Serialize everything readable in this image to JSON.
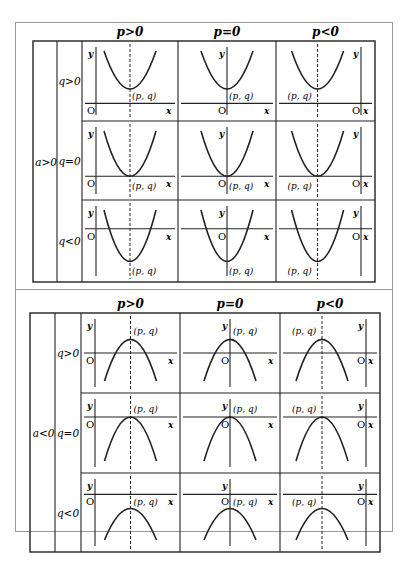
{
  "top_panel": {
    "a_label": "a>0",
    "columns": [
      "p>0",
      "p=0",
      "p<0"
    ],
    "rows": [
      "q>0",
      "q=0",
      "q<0"
    ]
  },
  "bottom_panel": {
    "a_label": "a<0",
    "columns": [
      "p>0",
      "p=0",
      "p<0"
    ],
    "rows": [
      "q>0",
      "q=0",
      "q<0"
    ]
  },
  "axis_labels": {
    "x": "x",
    "y": "y",
    "origin": "O"
  },
  "vertex_label": "(p, q)",
  "colors": {
    "line": "#222222",
    "frame": "#9a9a9a",
    "background": "#ffffff"
  }
}
